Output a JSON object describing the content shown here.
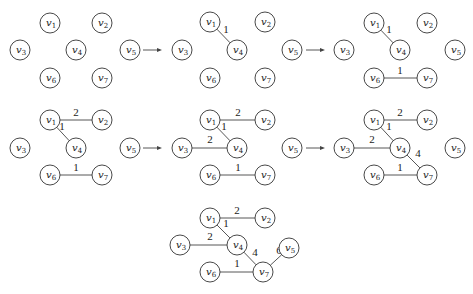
{
  "node_radius": 10,
  "vertex_prefix": "v",
  "panels": [
    {
      "id": "step-1",
      "nodes": {
        "1": [
          50,
          23
        ],
        "2": [
          102,
          23
        ],
        "3": [
          20,
          50
        ],
        "4": [
          76,
          50
        ],
        "5": [
          130,
          50
        ],
        "6": [
          50,
          78
        ],
        "7": [
          102,
          78
        ]
      },
      "edges": []
    },
    {
      "id": "step-2",
      "nodes": {
        "1": [
          210,
          22
        ],
        "2": [
          265,
          22
        ],
        "3": [
          182,
          50
        ],
        "4": [
          237,
          50
        ],
        "5": [
          292,
          50
        ],
        "6": [
          210,
          78
        ],
        "7": [
          265,
          78
        ]
      },
      "edges": [
        {
          "from": "1",
          "to": "4",
          "weight": "1",
          "label_pos": [
            226,
            33
          ]
        }
      ]
    },
    {
      "id": "step-3",
      "nodes": {
        "1": [
          374,
          23
        ],
        "2": [
          427,
          23
        ],
        "3": [
          344,
          50
        ],
        "4": [
          400,
          50
        ],
        "5": [
          455,
          50
        ],
        "6": [
          374,
          78
        ],
        "7": [
          427,
          78
        ]
      },
      "edges": [
        {
          "from": "1",
          "to": "4",
          "weight": "1",
          "label_pos": [
            389,
            33
          ]
        },
        {
          "from": "6",
          "to": "7",
          "weight": "1",
          "label_pos": [
            400,
            74
          ]
        }
      ]
    },
    {
      "id": "step-4",
      "nodes": {
        "1": [
          50,
          120
        ],
        "2": [
          102,
          120
        ],
        "3": [
          20,
          148
        ],
        "4": [
          76,
          148
        ],
        "5": [
          130,
          148
        ],
        "6": [
          50,
          175
        ],
        "7": [
          102,
          175
        ]
      },
      "edges": [
        {
          "from": "1",
          "to": "2",
          "weight": "2",
          "label_pos": [
            76,
            116
          ]
        },
        {
          "from": "1",
          "to": "4",
          "weight": "1",
          "label_pos": [
            62,
            130
          ]
        },
        {
          "from": "6",
          "to": "7",
          "weight": "1",
          "label_pos": [
            76,
            171
          ]
        }
      ]
    },
    {
      "id": "step-5",
      "nodes": {
        "1": [
          210,
          120
        ],
        "2": [
          265,
          120
        ],
        "3": [
          182,
          148
        ],
        "4": [
          237,
          148
        ],
        "5": [
          292,
          148
        ],
        "6": [
          210,
          175
        ],
        "7": [
          265,
          175
        ]
      },
      "edges": [
        {
          "from": "1",
          "to": "2",
          "weight": "2",
          "label_pos": [
            238,
            116
          ]
        },
        {
          "from": "1",
          "to": "4",
          "weight": "1",
          "label_pos": [
            224,
            130
          ]
        },
        {
          "from": "3",
          "to": "4",
          "weight": "2",
          "label_pos": [
            210,
            143
          ]
        },
        {
          "from": "6",
          "to": "7",
          "weight": "1",
          "label_pos": [
            238,
            171
          ]
        }
      ]
    },
    {
      "id": "step-6",
      "nodes": {
        "1": [
          374,
          120
        ],
        "2": [
          427,
          120
        ],
        "3": [
          344,
          148
        ],
        "4": [
          400,
          148
        ],
        "5": [
          455,
          148
        ],
        "6": [
          374,
          175
        ],
        "7": [
          427,
          175
        ]
      },
      "edges": [
        {
          "from": "1",
          "to": "2",
          "weight": "2",
          "label_pos": [
            400,
            116
          ]
        },
        {
          "from": "1",
          "to": "4",
          "weight": "1",
          "label_pos": [
            389,
            130
          ]
        },
        {
          "from": "3",
          "to": "4",
          "weight": "2",
          "label_pos": [
            372,
            143
          ]
        },
        {
          "from": "4",
          "to": "7",
          "weight": "4",
          "label_pos": [
            418,
            157
          ]
        },
        {
          "from": "6",
          "to": "7",
          "weight": "1",
          "label_pos": [
            400,
            171
          ]
        }
      ]
    },
    {
      "id": "step-7",
      "nodes": {
        "1": [
          210,
          218
        ],
        "2": [
          265,
          218
        ],
        "3": [
          180,
          245
        ],
        "4": [
          237,
          245
        ],
        "5": [
          289,
          248
        ],
        "6": [
          210,
          272
        ],
        "7": [
          263,
          272
        ]
      },
      "edges": [
        {
          "from": "1",
          "to": "2",
          "weight": "2",
          "label_pos": [
            237,
            214
          ]
        },
        {
          "from": "1",
          "to": "4",
          "weight": "1",
          "label_pos": [
            226,
            227
          ]
        },
        {
          "from": "3",
          "to": "4",
          "weight": "2",
          "label_pos": [
            210,
            240
          ]
        },
        {
          "from": "4",
          "to": "7",
          "weight": "4",
          "label_pos": [
            255,
            256
          ]
        },
        {
          "from": "7",
          "to": "5",
          "weight": "6",
          "label_pos": [
            279,
            254
          ]
        },
        {
          "from": "6",
          "to": "7",
          "weight": "1",
          "label_pos": [
            237,
            267
          ]
        }
      ]
    }
  ],
  "arrows": [
    {
      "x1": 143,
      "y1": 50,
      "x2": 162,
      "y2": 50
    },
    {
      "x1": 306,
      "y1": 50,
      "x2": 325,
      "y2": 50
    },
    {
      "x1": 143,
      "y1": 148,
      "x2": 162,
      "y2": 148
    },
    {
      "x1": 306,
      "y1": 148,
      "x2": 325,
      "y2": 148
    }
  ]
}
